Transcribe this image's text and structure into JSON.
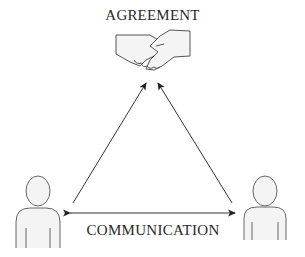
{
  "diagram": {
    "top_label": "AGREEMENT",
    "bottom_label": "COMMUNICATION",
    "nodes": [
      {
        "id": "agreement",
        "icon": "handshake-icon",
        "label": "AGREEMENT"
      },
      {
        "id": "person-left",
        "icon": "person-icon"
      },
      {
        "id": "person-right",
        "icon": "person-icon"
      }
    ],
    "edges": [
      {
        "from": "person-left",
        "to": "agreement",
        "type": "arrow"
      },
      {
        "from": "person-right",
        "to": "agreement",
        "type": "arrow"
      },
      {
        "from": "person-left",
        "to": "person-right",
        "type": "double-arrow",
        "label": "COMMUNICATION"
      }
    ],
    "colors": {
      "line": "#333333",
      "icon_stroke": "#555555",
      "icon_fill": "#f4f4f4"
    }
  }
}
